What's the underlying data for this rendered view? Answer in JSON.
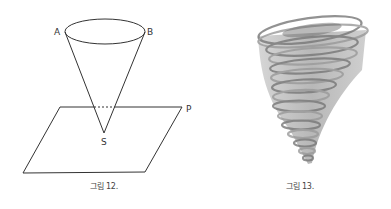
{
  "figures": [
    {
      "id": "fig12",
      "caption": "그림 12.",
      "description": "Inverted cone with apex S piercing plane P",
      "labels": {
        "a": "A",
        "b": "B",
        "s": "S",
        "p": "P"
      }
    },
    {
      "id": "fig13",
      "caption": "그림 13.",
      "description": "Grayscale tornado illustration"
    }
  ],
  "colors": {
    "line": "#333333",
    "text": "#444444",
    "tornado": "#8a8a8a"
  }
}
